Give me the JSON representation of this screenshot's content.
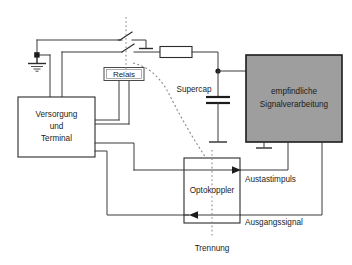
{
  "diagram": {
    "language": "de",
    "background_color": "#ffffff",
    "line_color": "#2b2b2b",
    "shaded_block_color": "#9e9e9e"
  },
  "blocks": {
    "supply": {
      "name": "supply-terminal-block",
      "lines": [
        "Versorgung",
        "und",
        "Terminal"
      ],
      "line1": "Versorgung",
      "line2": "und",
      "line3": "Terminal",
      "fill": "#ffffff"
    },
    "relay": {
      "name": "relay-label-block",
      "label": "Relais",
      "fill": "#ffffff"
    },
    "signal_processing": {
      "name": "sensitive-signal-processing-block",
      "line1": "empfindliche",
      "line2": "Signalverarbeitung",
      "fill": "#9e9e9e"
    },
    "optocoupler": {
      "name": "optocoupler-block",
      "label": "Optokoppler",
      "fill": "#ffffff"
    }
  },
  "components": {
    "resistor": {
      "name": "resistor",
      "label": ""
    },
    "supercap": {
      "name": "supercap-capacitor",
      "label": "Supercap"
    },
    "switch": {
      "name": "relay-contact-switch",
      "label": ""
    },
    "ground_left": {
      "name": "ground-symbol-left",
      "label": ""
    },
    "ground_supercap": {
      "name": "ground-symbol-supercap",
      "label": ""
    },
    "ground_signal": {
      "name": "ground-symbol-signal-block",
      "label": ""
    },
    "ground_switch": {
      "name": "ground-symbol-switch",
      "label": ""
    }
  },
  "signals": {
    "blanking_pulse": "Austastimpuls",
    "output_signal": "Ausgangssignal",
    "isolation": "Trennung"
  }
}
